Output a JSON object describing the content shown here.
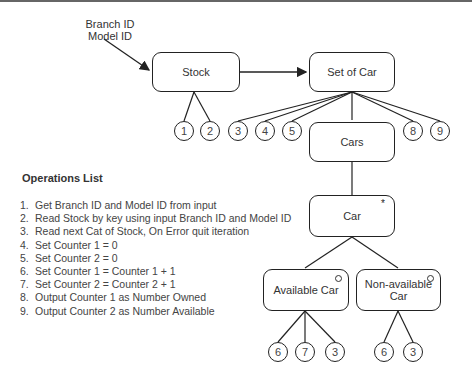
{
  "diagram": {
    "input_label": [
      "Branch ID",
      "Model ID"
    ],
    "nodes": {
      "stock": {
        "label": "Stock"
      },
      "set_of_car": {
        "label": "Set of Car"
      },
      "cars": {
        "label": "Cars"
      },
      "car": {
        "label": "Car",
        "marker": "*"
      },
      "available_car": {
        "label": "Available Car",
        "marker": "o"
      },
      "non_available_car": {
        "label": "Non-available Car",
        "label_lines": [
          "Non-available",
          "Car"
        ],
        "marker": "o"
      }
    },
    "operation_refs": {
      "stock": [
        "1",
        "2"
      ],
      "set_of_car_left": [
        "3",
        "4",
        "5"
      ],
      "set_of_car_right": [
        "8",
        "9"
      ],
      "available_car": [
        "6",
        "7",
        "3"
      ],
      "non_available_car": [
        "6",
        "3"
      ]
    }
  },
  "operations": {
    "title": "Operations List",
    "items": [
      {
        "num": "1.",
        "text": "Get Branch ID and Model ID from input"
      },
      {
        "num": "2.",
        "text": "Read Stock by key using input Branch ID and Model ID"
      },
      {
        "num": "3.",
        "text": "Read next Cat of Stock, On Error quit iteration"
      },
      {
        "num": "4.",
        "text": "Set Counter 1 = 0"
      },
      {
        "num": "5.",
        "text": "Set Counter 2 = 0"
      },
      {
        "num": "6.",
        "text": "Set Counter 1 = Counter 1 + 1"
      },
      {
        "num": "7.",
        "text": "Set Counter 2 = Counter 2 + 1"
      },
      {
        "num": "8.",
        "text": "Output Counter 1 as Number Owned"
      },
      {
        "num": "9.",
        "text": "Output Counter 2 as Number Available"
      }
    ]
  }
}
